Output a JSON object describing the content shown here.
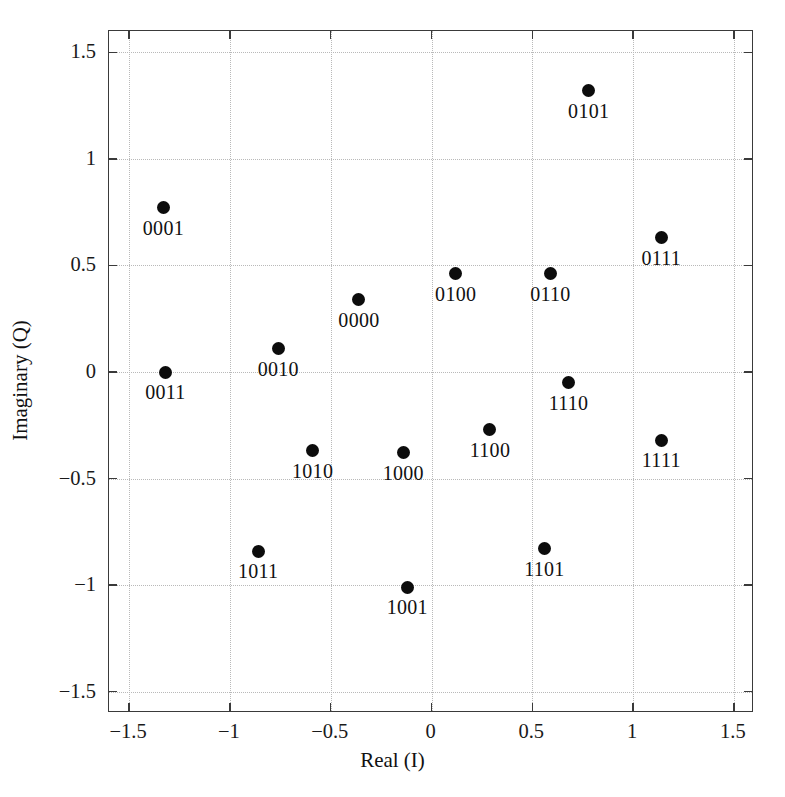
{
  "chart_data": {
    "type": "scatter",
    "title": "",
    "xlabel": "Real (I)",
    "ylabel": "Imaginary (Q)",
    "xlim": [
      -1.6,
      1.6
    ],
    "ylim": [
      -1.6,
      1.6
    ],
    "xticks": [
      -1.5,
      -1,
      -0.5,
      0,
      0.5,
      1,
      1.5
    ],
    "yticks": [
      -1.5,
      -1,
      -0.5,
      0,
      0.5,
      1,
      1.5
    ],
    "xticklabels": [
      "-1.5",
      "-1",
      "-0.5",
      "0",
      "0.5",
      "1",
      "1.5"
    ],
    "yticklabels": [
      "-1.5",
      "-1",
      "-0.5",
      "0",
      "0.5",
      "1",
      "1.5"
    ],
    "grid": true,
    "legend": "none",
    "marker": "filled-circle",
    "marker_color": "#0c0c0c",
    "points": [
      {
        "label": "0101",
        "x": 0.78,
        "y": 1.32
      },
      {
        "label": "0001",
        "x": -1.33,
        "y": 0.77
      },
      {
        "label": "0111",
        "x": 1.14,
        "y": 0.63
      },
      {
        "label": "0100",
        "x": 0.12,
        "y": 0.46
      },
      {
        "label": "0110",
        "x": 0.59,
        "y": 0.46
      },
      {
        "label": "0000",
        "x": -0.36,
        "y": 0.34
      },
      {
        "label": "0010",
        "x": -0.76,
        "y": 0.11
      },
      {
        "label": "0011",
        "x": -1.32,
        "y": 0.0
      },
      {
        "label": "1110",
        "x": 0.68,
        "y": -0.05
      },
      {
        "label": "1100",
        "x": 0.29,
        "y": -0.27
      },
      {
        "label": "1111",
        "x": 1.14,
        "y": -0.32
      },
      {
        "label": "1010",
        "x": -0.59,
        "y": -0.37
      },
      {
        "label": "1000",
        "x": -0.14,
        "y": -0.38
      },
      {
        "label": "1101",
        "x": 0.56,
        "y": -0.83
      },
      {
        "label": "1011",
        "x": -0.86,
        "y": -0.84
      },
      {
        "label": "1001",
        "x": -0.12,
        "y": -1.01
      }
    ]
  }
}
